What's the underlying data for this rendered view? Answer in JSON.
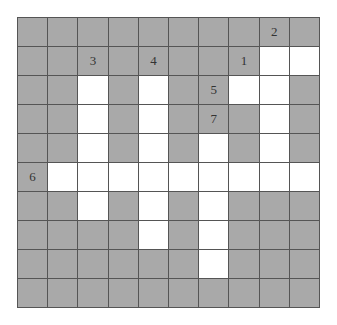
{
  "puzzle": {
    "type": "crossword",
    "rows": 10,
    "cols": 10,
    "colors": {
      "block": "#a9a9a9",
      "open": "#ffffff",
      "line": "#555555"
    },
    "grid": [
      "##########",
      "########..",
      "##.#.##..#",
      "##.#.###.#",
      "##.#.#.#.#",
      "#.........",
      "##.#.#.###",
      "####.#.###",
      "######.###",
      "##########"
    ],
    "clue_numbers": [
      {
        "number": "2",
        "row": 0,
        "col": 8
      },
      {
        "number": "3",
        "row": 1,
        "col": 2
      },
      {
        "number": "4",
        "row": 1,
        "col": 4
      },
      {
        "number": "1",
        "row": 1,
        "col": 7
      },
      {
        "number": "5",
        "row": 2,
        "col": 6
      },
      {
        "number": "7",
        "row": 3,
        "col": 6
      },
      {
        "number": "6",
        "row": 5,
        "col": 0
      }
    ]
  }
}
